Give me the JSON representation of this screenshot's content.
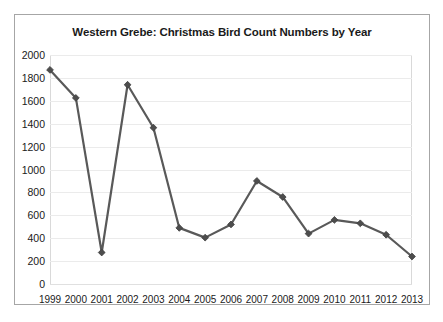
{
  "chart_data": {
    "type": "line",
    "title": "Western Grebe: Christmas Bird Count Numbers by Year",
    "xlabel": "",
    "ylabel": "",
    "categories": [
      "1999",
      "2000",
      "2001",
      "2002",
      "2003",
      "2004",
      "2005",
      "2006",
      "2007",
      "2008",
      "2009",
      "2010",
      "2011",
      "2012",
      "2013"
    ],
    "values": [
      1870,
      1625,
      275,
      1740,
      1365,
      490,
      405,
      520,
      900,
      760,
      440,
      560,
      530,
      430,
      240
    ],
    "series": [
      {
        "name": "Western Grebe count",
        "values": [
          1870,
          1625,
          275,
          1740,
          1365,
          490,
          405,
          520,
          900,
          760,
          440,
          560,
          530,
          430,
          240
        ]
      }
    ],
    "ylim": [
      0,
      2000
    ],
    "ytick_step": 200,
    "yticks": [
      "2000",
      "1800",
      "1600",
      "1400",
      "1200",
      "1000",
      "800",
      "600",
      "400",
      "200",
      "0"
    ],
    "xticks": [
      "1999",
      "2000",
      "2001",
      "2002",
      "2003",
      "2004",
      "2005",
      "2006",
      "2007",
      "2008",
      "2009",
      "2010",
      "2011",
      "2012",
      "2013"
    ],
    "grid": "horizontal",
    "legend": "none",
    "marker": "diamond",
    "line_color": "#595959",
    "marker_color": "#4d4d4d",
    "gridline_color": "#ebebeb",
    "axis_color": "#d9d9d9",
    "border_color": "#a6a6a6",
    "background": "#ffffff",
    "text_color": "#1a1a1a"
  }
}
